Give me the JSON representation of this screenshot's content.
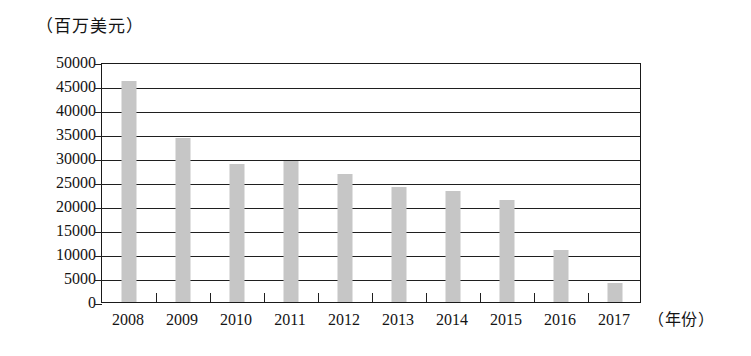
{
  "chart_data": {
    "type": "bar",
    "title": "",
    "ylabel": "（百万美元）",
    "xlabel": "（年份）",
    "categories": [
      "2008",
      "2009",
      "2010",
      "2011",
      "2012",
      "2013",
      "2014",
      "2015",
      "2016",
      "2017"
    ],
    "values": [
      46000,
      34200,
      28800,
      29300,
      26700,
      24000,
      23200,
      21200,
      10800,
      3900
    ],
    "ylim": [
      0,
      50000
    ],
    "y_ticks": [
      0,
      5000,
      10000,
      15000,
      20000,
      25000,
      30000,
      35000,
      40000,
      45000,
      50000
    ],
    "y_tick_labels": [
      "0",
      "5000",
      "10000",
      "15000",
      "20000",
      "25000",
      "30000",
      "35000",
      "40000",
      "45000",
      "50000"
    ],
    "grid": true,
    "legend": false,
    "bar_color": "#c6c6c6",
    "axis_color": "#1f1f1f",
    "background": "#ffffff"
  }
}
